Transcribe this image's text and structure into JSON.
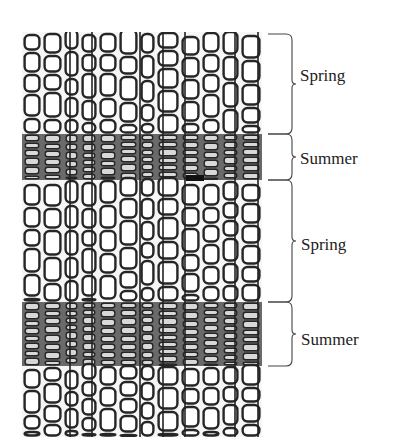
{
  "figure": {
    "panel": {
      "x": 22,
      "y": 32,
      "width": 240,
      "height": 405,
      "cell_wall_color": "#2a2a2a",
      "background": "#f6f6f6"
    },
    "bands": [
      {
        "season": "spring",
        "y_top": 32,
        "y_bottom": 134,
        "cell_height": 24
      },
      {
        "season": "summer",
        "y_top": 134,
        "y_bottom": 180,
        "cell_height": 7
      },
      {
        "season": "spring",
        "y_top": 180,
        "y_bottom": 302,
        "cell_height": 24
      },
      {
        "season": "summer",
        "y_top": 302,
        "y_bottom": 366,
        "cell_height": 7
      },
      {
        "season": "spring",
        "y_top": 366,
        "y_bottom": 437,
        "cell_height": 22
      }
    ],
    "braces": [
      {
        "label": "Spring",
        "y_top": 34,
        "y_bottom": 134
      },
      {
        "label": "Summer",
        "y_top": 134,
        "y_bottom": 180
      },
      {
        "label": "Spring",
        "y_top": 180,
        "y_bottom": 302
      },
      {
        "label": "Summer",
        "y_top": 302,
        "y_bottom": 366
      }
    ]
  },
  "labels": {
    "spring_1": "Spring",
    "summer_1": "Summer",
    "spring_2": "Spring",
    "summer_2": "Summer"
  }
}
